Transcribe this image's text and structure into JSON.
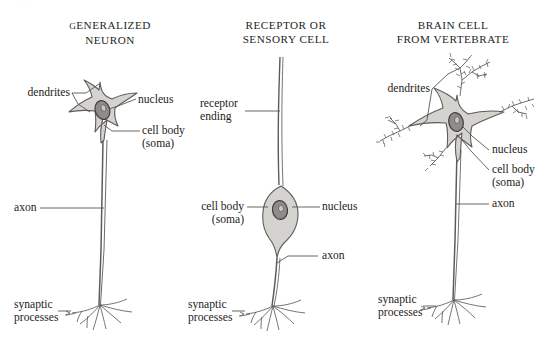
{
  "page": {
    "top_caption": "      .       .           .         .            .       .",
    "background": "#ffffff",
    "ink": "#1d1c1a",
    "soma_fill": "#d4d3d0",
    "soma_stroke": "#5d5c59",
    "nucleus_fill": "#8d8c88",
    "nucleus_stroke": "#4a4947",
    "leader_color": "#585754"
  },
  "columns": [
    {
      "id": "generalized-neuron",
      "heading": {
        "line1_first": "G",
        "line1_rest": "ENERALIZED",
        "line2": "NEURON"
      },
      "labels": {
        "dendrites": "dendrites",
        "nucleus": "nucleus",
        "cell_body_line1": "cell body",
        "cell_body_line2": "(soma)",
        "axon": "axon",
        "synaptic_line1": "synaptic",
        "synaptic_line2": "processes"
      }
    },
    {
      "id": "receptor-sensory-cell",
      "heading": {
        "line1": "RECEPTOR OR",
        "line2": "SENSORY CELL"
      },
      "labels": {
        "receptor_line1": "receptor",
        "receptor_line2": "ending",
        "cell_body_line1": "cell body",
        "cell_body_line2": "(soma)",
        "nucleus": "nucleus",
        "axon": "axon",
        "synaptic_line1": "synaptic",
        "synaptic_line2": "processes"
      }
    },
    {
      "id": "brain-cell-vertebrate",
      "heading": {
        "line1": "BRAIN CELL",
        "line2": "FROM VERTEBRATE"
      },
      "labels": {
        "dendrites": "dendrites",
        "nucleus": "nucleus",
        "cell_body_line1": "cell body",
        "cell_body_line2": "(soma)",
        "axon": "axon",
        "synaptic_line1": "synaptic",
        "synaptic_line2": "processes"
      }
    }
  ]
}
